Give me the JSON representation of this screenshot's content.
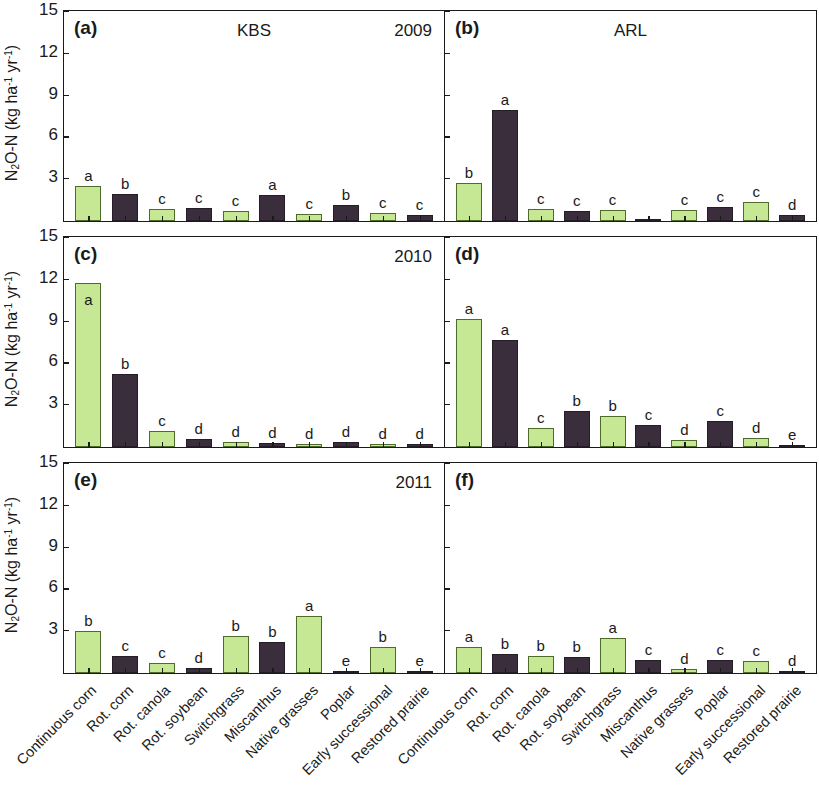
{
  "axis": {
    "y_label_prefix": "N",
    "y_label_sub": "2",
    "y_label_mid": "O-N (kg ha",
    "y_label_sup1": "-1",
    "y_label_mid2": " yr",
    "y_label_sup2": "-1",
    "y_label_end": ")",
    "y_label_full": "N2O-N (kg ha-1 yr-1)",
    "y_ticks": [
      "15",
      "12",
      "9",
      "6",
      "3"
    ],
    "y_min": 0,
    "y_max": 15
  },
  "categories": [
    "Continuous corn",
    "Rot. corn",
    "Rot. canola",
    "Rot. soybean",
    "Switchgrass",
    "Miscanthus",
    "Native grasses",
    "Poplar",
    "Early successional",
    "Restored prairie"
  ],
  "colors": {
    "green_fill": "#c6e894",
    "green_edge": "#4e6b2a",
    "dark_fill": "#3a2e3c",
    "dark_edge": "#241c26",
    "axis": "#1a1a1a"
  },
  "panels": [
    {
      "tag": "(a)",
      "site": "KBS",
      "year": "2009",
      "values": [
        2.5,
        1.95,
        0.85,
        0.95,
        0.75,
        1.9,
        0.5,
        1.15,
        0.6,
        0.45
      ],
      "letters": [
        "a",
        "b",
        "c",
        "c",
        "c",
        "a",
        "c",
        "b",
        "c",
        "c"
      ],
      "series": [
        "green",
        "dark",
        "green",
        "dark",
        "green",
        "dark",
        "green",
        "dark",
        "green",
        "dark"
      ]
    },
    {
      "tag": "(b)",
      "site": "ARL",
      "year": "",
      "values": [
        2.75,
        7.95,
        0.85,
        0.75,
        0.8,
        0.05,
        0.8,
        1.0,
        1.35,
        0.45
      ],
      "letters": [
        "b",
        "a",
        "c",
        "c",
        "c",
        "",
        "c",
        "c",
        "c",
        "d"
      ],
      "series": [
        "green",
        "dark",
        "green",
        "dark",
        "green",
        "dark",
        "green",
        "dark",
        "green",
        "dark"
      ]
    },
    {
      "tag": "(c)",
      "site": "",
      "year": "2010",
      "values": [
        11.8,
        5.25,
        1.15,
        0.55,
        0.35,
        0.3,
        0.2,
        0.35,
        0.25,
        0.25
      ],
      "letters": [
        "a",
        "b",
        "c",
        "d",
        "d",
        "d",
        "d",
        "d",
        "d",
        "d"
      ],
      "series": [
        "green",
        "dark",
        "green",
        "dark",
        "green",
        "dark",
        "green",
        "dark",
        "green",
        "dark"
      ]
    },
    {
      "tag": "(d)",
      "site": "",
      "year": "",
      "values": [
        9.2,
        7.7,
        1.4,
        2.6,
        2.2,
        1.6,
        0.5,
        1.85,
        0.65,
        0.12
      ],
      "letters": [
        "a",
        "a",
        "c",
        "b",
        "b",
        "c",
        "d",
        "c",
        "d",
        "e"
      ],
      "series": [
        "green",
        "dark",
        "green",
        "dark",
        "green",
        "dark",
        "green",
        "dark",
        "green",
        "dark"
      ]
    },
    {
      "tag": "(e)",
      "site": "",
      "year": "2011",
      "values": [
        3.05,
        1.25,
        0.7,
        0.35,
        2.65,
        2.25,
        4.1,
        0.1,
        1.85,
        0.15
      ],
      "letters": [
        "b",
        "c",
        "c",
        "d",
        "b",
        "b",
        "a",
        "e",
        "b",
        "e"
      ],
      "series": [
        "green",
        "dark",
        "green",
        "dark",
        "green",
        "dark",
        "green",
        "dark",
        "green",
        "dark"
      ]
    },
    {
      "tag": "(f)",
      "site": "",
      "year": "",
      "values": [
        1.85,
        1.35,
        1.2,
        1.15,
        2.5,
        0.9,
        0.3,
        0.95,
        0.85,
        0.15
      ],
      "letters": [
        "a",
        "b",
        "b",
        "b",
        "a",
        "c",
        "d",
        "c",
        "c",
        "d"
      ],
      "series": [
        "green",
        "dark",
        "green",
        "dark",
        "green",
        "dark",
        "green",
        "dark",
        "green",
        "dark"
      ]
    }
  ],
  "chart_data": {
    "type": "bar",
    "title": "",
    "xlabel": "",
    "ylabel": "N2O-N (kg ha-1 yr-1)",
    "ylim": [
      0,
      15
    ],
    "yticks": [
      3,
      6,
      9,
      12,
      15
    ],
    "grid": false,
    "legend": "none",
    "categories": [
      "Continuous corn",
      "Rot. corn",
      "Rot. canola",
      "Rot. soybean",
      "Switchgrass",
      "Miscanthus",
      "Native grasses",
      "Poplar",
      "Early successional",
      "Restored prairie"
    ],
    "panels": [
      {
        "panel": "(a)",
        "site": "KBS",
        "year": "2009",
        "values": [
          2.5,
          1.95,
          0.85,
          0.95,
          0.75,
          1.9,
          0.5,
          1.15,
          0.6,
          0.45
        ],
        "significance_letters": [
          "a",
          "b",
          "c",
          "c",
          "c",
          "a",
          "c",
          "b",
          "c",
          "c"
        ]
      },
      {
        "panel": "(b)",
        "site": "ARL",
        "year": "2009",
        "values": [
          2.75,
          7.95,
          0.85,
          0.75,
          0.8,
          0.05,
          0.8,
          1.0,
          1.35,
          0.45
        ],
        "significance_letters": [
          "b",
          "a",
          "c",
          "c",
          "c",
          "",
          "c",
          "c",
          "c",
          "d"
        ]
      },
      {
        "panel": "(c)",
        "site": "KBS",
        "year": "2010",
        "values": [
          11.8,
          5.25,
          1.15,
          0.55,
          0.35,
          0.3,
          0.2,
          0.35,
          0.25,
          0.25
        ],
        "significance_letters": [
          "a",
          "b",
          "c",
          "d",
          "d",
          "d",
          "d",
          "d",
          "d",
          "d"
        ]
      },
      {
        "panel": "(d)",
        "site": "ARL",
        "year": "2010",
        "values": [
          9.2,
          7.7,
          1.4,
          2.6,
          2.2,
          1.6,
          0.5,
          1.85,
          0.65,
          0.12
        ],
        "significance_letters": [
          "a",
          "a",
          "c",
          "b",
          "b",
          "c",
          "d",
          "c",
          "d",
          "e"
        ]
      },
      {
        "panel": "(e)",
        "site": "KBS",
        "year": "2011",
        "values": [
          3.05,
          1.25,
          0.7,
          0.35,
          2.65,
          2.25,
          4.1,
          0.1,
          1.85,
          0.15
        ],
        "significance_letters": [
          "b",
          "c",
          "c",
          "d",
          "b",
          "b",
          "a",
          "e",
          "b",
          "e"
        ]
      },
      {
        "panel": "(f)",
        "site": "ARL",
        "year": "2011",
        "values": [
          1.85,
          1.35,
          1.2,
          1.15,
          2.5,
          0.9,
          0.3,
          0.95,
          0.85,
          0.15
        ],
        "significance_letters": [
          "a",
          "b",
          "b",
          "b",
          "a",
          "c",
          "d",
          "c",
          "c",
          "d"
        ]
      }
    ]
  }
}
